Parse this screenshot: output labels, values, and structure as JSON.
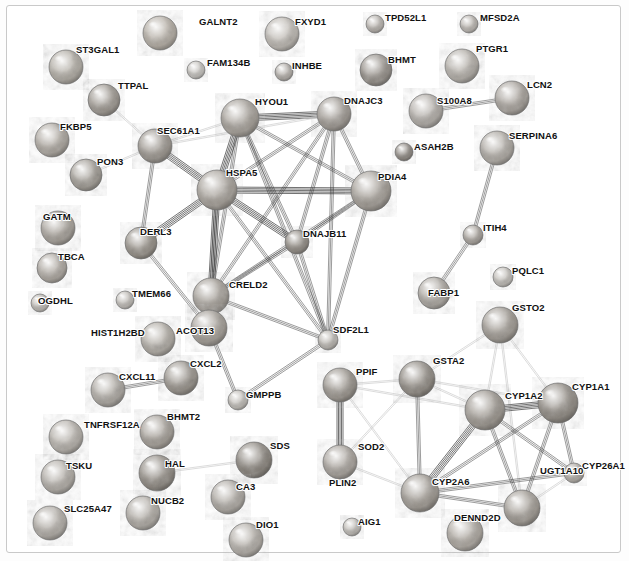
{
  "view": {
    "width": 629,
    "height": 561,
    "background": "#ffffff",
    "border_color": "#c9c9c9",
    "title": "Protein-protein interaction network"
  },
  "style": {
    "edge_color_dark": "#3a3a3a",
    "edge_color_mid": "#8a8a8a",
    "edge_color_light": "#c4c4c4",
    "label_color": "#111111",
    "node_outline": "#6e6e6e"
  },
  "nodes": [
    {
      "id": "GALNT2",
      "label": "GALNT2",
      "x": 160,
      "y": 33,
      "r": 17,
      "fill": "#b9b2a8",
      "lx": 199,
      "ly": 16
    },
    {
      "id": "FXYD1",
      "label": "FXYD1",
      "x": 282,
      "y": 34,
      "r": 17,
      "fill": "#c2bdb6",
      "lx": 295,
      "ly": 16
    },
    {
      "id": "TPD52L1",
      "label": "TPD52L1",
      "x": 375,
      "y": 24,
      "r": 9,
      "fill": "#b8b3ad",
      "lx": 385,
      "ly": 12
    },
    {
      "id": "MFSD2A",
      "label": "MFSD2A",
      "x": 469,
      "y": 24,
      "r": 9,
      "fill": "#bab5af",
      "lx": 480,
      "ly": 12
    },
    {
      "id": "ST3GAL1",
      "label": "ST3GAL1",
      "x": 66,
      "y": 67,
      "r": 17,
      "fill": "#b5b0a7",
      "lx": 76,
      "ly": 44
    },
    {
      "id": "FAM134B",
      "label": "FAM134B",
      "x": 196,
      "y": 70,
      "r": 9,
      "fill": "#c8c5c0",
      "lx": 207,
      "ly": 57
    },
    {
      "id": "INHBE",
      "label": "INHBE",
      "x": 284,
      "y": 72,
      "r": 9,
      "fill": "#b4afa9",
      "lx": 292,
      "ly": 60
    },
    {
      "id": "BHMT",
      "label": "BHMT",
      "x": 376,
      "y": 70,
      "r": 16,
      "fill": "#97918a",
      "lx": 388,
      "ly": 54
    },
    {
      "id": "PTGR1",
      "label": "PTGR1",
      "x": 462,
      "y": 66,
      "r": 17,
      "fill": "#b7b2ab",
      "lx": 476,
      "ly": 43
    },
    {
      "id": "TTPAL",
      "label": "TTPAL",
      "x": 104,
      "y": 100,
      "r": 16,
      "fill": "#a09a92",
      "lx": 118,
      "ly": 80
    },
    {
      "id": "HYOU1",
      "label": "HYOU1",
      "x": 240,
      "y": 118,
      "r": 19,
      "fill": "#a8a29a",
      "lx": 255,
      "ly": 96
    },
    {
      "id": "DNAJC3",
      "label": "DNAJC3",
      "x": 334,
      "y": 114,
      "r": 17,
      "fill": "#a39d96",
      "lx": 344,
      "ly": 95
    },
    {
      "id": "S100A8",
      "label": "S100A8",
      "x": 426,
      "y": 111,
      "r": 17,
      "fill": "#b6b1ab",
      "lx": 437,
      "ly": 95
    },
    {
      "id": "LCN2",
      "label": "LCN2",
      "x": 512,
      "y": 98,
      "r": 17,
      "fill": "#aaa49d",
      "lx": 527,
      "ly": 79
    },
    {
      "id": "FKBP5",
      "label": "FKBP5",
      "x": 52,
      "y": 140,
      "r": 17,
      "fill": "#b1aba3",
      "lx": 60,
      "ly": 121
    },
    {
      "id": "SEC61A1",
      "label": "SEC61A1",
      "x": 155,
      "y": 146,
      "r": 17,
      "fill": "#9f9991",
      "lx": 157,
      "ly": 125
    },
    {
      "id": "SERPINA6",
      "label": "SERPINA6",
      "x": 497,
      "y": 148,
      "r": 17,
      "fill": "#b2ada6",
      "lx": 509,
      "ly": 130
    },
    {
      "id": "ASAH2B",
      "label": "ASAH2B",
      "x": 404,
      "y": 152,
      "r": 9,
      "fill": "#8e8881",
      "lx": 414,
      "ly": 141
    },
    {
      "id": "PON3",
      "label": "PON3",
      "x": 86,
      "y": 175,
      "r": 16,
      "fill": "#a5a098",
      "lx": 97,
      "ly": 156
    },
    {
      "id": "HSPA5",
      "label": "HSPA5",
      "x": 217,
      "y": 190,
      "r": 20,
      "fill": "#a9a39b",
      "lx": 226,
      "ly": 167
    },
    {
      "id": "PDIA4",
      "label": "PDIA4",
      "x": 371,
      "y": 191,
      "r": 20,
      "fill": "#a8a29a",
      "lx": 378,
      "ly": 171
    },
    {
      "id": "GATM",
      "label": "GATM",
      "x": 58,
      "y": 228,
      "r": 17,
      "fill": "#aaa49c",
      "lx": 43,
      "ly": 211
    },
    {
      "id": "DERL3",
      "label": "DERL3",
      "x": 141,
      "y": 243,
      "r": 16,
      "fill": "#989289",
      "lx": 140,
      "ly": 226
    },
    {
      "id": "DNAJB11",
      "label": "DNAJB11",
      "x": 297,
      "y": 242,
      "r": 12,
      "fill": "#918b83",
      "lx": 303,
      "ly": 228
    },
    {
      "id": "ITIH4",
      "label": "ITIH4",
      "x": 473,
      "y": 235,
      "r": 10,
      "fill": "#a9a39c",
      "lx": 483,
      "ly": 222
    },
    {
      "id": "TBCA",
      "label": "TBCA",
      "x": 52,
      "y": 268,
      "r": 15,
      "fill": "#b0aaa2",
      "lx": 58,
      "ly": 251
    },
    {
      "id": "PQLC1",
      "label": "PQLC1",
      "x": 503,
      "y": 277,
      "r": 10,
      "fill": "#c4c0ba",
      "lx": 512,
      "ly": 265
    },
    {
      "id": "CRELD2",
      "label": "CRELD2",
      "x": 211,
      "y": 296,
      "r": 18,
      "fill": "#a6a098",
      "lx": 229,
      "ly": 279
    },
    {
      "id": "TMEM66",
      "label": "TMEM66",
      "x": 125,
      "y": 300,
      "r": 9,
      "fill": "#c1bdb7",
      "lx": 132,
      "ly": 288
    },
    {
      "id": "OGDHL",
      "label": "OGDHL",
      "x": 40,
      "y": 303,
      "r": 9,
      "fill": "#c0bcb6",
      "lx": 38,
      "ly": 295
    },
    {
      "id": "FABP1",
      "label": "FABP1",
      "x": 434,
      "y": 293,
      "r": 16,
      "fill": "#b0aba4",
      "lx": 428,
      "ly": 287
    },
    {
      "id": "GSTO2",
      "label": "GSTO2",
      "x": 500,
      "y": 325,
      "r": 18,
      "fill": "#a39d95",
      "lx": 512,
      "ly": 302
    },
    {
      "id": "SDF2L1",
      "label": "SDF2L1",
      "x": 328,
      "y": 340,
      "r": 10,
      "fill": "#bcb8b2",
      "lx": 333,
      "ly": 324
    },
    {
      "id": "HIST1H2BD",
      "label": "HIST1H2BD",
      "x": 158,
      "y": 339,
      "r": 17,
      "fill": "#b4afa7",
      "lx": 91,
      "ly": 327
    },
    {
      "id": "ACOT13",
      "label": "ACOT13",
      "x": 209,
      "y": 328,
      "r": 18,
      "fill": "#a7a199",
      "lx": 176,
      "ly": 325
    },
    {
      "id": "CXCL2",
      "label": "CXCL2",
      "x": 181,
      "y": 378,
      "r": 17,
      "fill": "#9b958d",
      "lx": 190,
      "ly": 358
    },
    {
      "id": "PPIF",
      "label": "PPIF",
      "x": 340,
      "y": 385,
      "r": 17,
      "fill": "#9d978f",
      "lx": 356,
      "ly": 366
    },
    {
      "id": "GSTA2",
      "label": "GSTA2",
      "x": 417,
      "y": 379,
      "r": 18,
      "fill": "#938d85",
      "lx": 433,
      "ly": 355
    },
    {
      "id": "CYP1A2",
      "label": "CYP1A2",
      "x": 485,
      "y": 410,
      "r": 20,
      "fill": "#a09a92",
      "lx": 505,
      "ly": 390
    },
    {
      "id": "CYP1A1",
      "label": "CYP1A1",
      "x": 558,
      "y": 403,
      "r": 20,
      "fill": "#938d85",
      "lx": 572,
      "ly": 381
    },
    {
      "id": "CXCL11",
      "label": "CXCL11",
      "x": 108,
      "y": 390,
      "r": 17,
      "fill": "#b1aca5",
      "lx": 119,
      "ly": 371
    },
    {
      "id": "GMPPB",
      "label": "GMPPB",
      "x": 238,
      "y": 400,
      "r": 10,
      "fill": "#c3bfb9",
      "lx": 246,
      "ly": 389
    },
    {
      "id": "TNFRSF12A",
      "label": "TNFRSF12A",
      "x": 66,
      "y": 437,
      "r": 17,
      "fill": "#b9b4ad",
      "lx": 84,
      "ly": 419
    },
    {
      "id": "BHMT2",
      "label": "BHMT2",
      "x": 157,
      "y": 432,
      "r": 17,
      "fill": "#a8a29a",
      "lx": 167,
      "ly": 411
    },
    {
      "id": "SDS",
      "label": "SDS",
      "x": 254,
      "y": 460,
      "r": 18,
      "fill": "#8b857d",
      "lx": 270,
      "ly": 440
    },
    {
      "id": "PLIN2",
      "label": "PLIN2",
      "x": 340,
      "y": 462,
      "r": 17,
      "fill": "#aaa49d",
      "lx": 329,
      "ly": 477
    },
    {
      "id": "SOD2",
      "label": "SOD2",
      "x": 340,
      "y": 462,
      "r": 0,
      "fill": "none",
      "lx": 358,
      "ly": 441
    },
    {
      "id": "TSKU",
      "label": "TSKU",
      "x": 58,
      "y": 477,
      "r": 17,
      "fill": "#b6b1aa",
      "lx": 66,
      "ly": 460
    },
    {
      "id": "HAL",
      "label": "HAL",
      "x": 157,
      "y": 473,
      "r": 18,
      "fill": "#938d85",
      "lx": 165,
      "ly": 458
    },
    {
      "id": "CA3",
      "label": "CA3",
      "x": 228,
      "y": 497,
      "r": 17,
      "fill": "#b2ada6",
      "lx": 236,
      "ly": 481
    },
    {
      "id": "CYP2A6",
      "label": "CYP2A6",
      "x": 420,
      "y": 493,
      "r": 19,
      "fill": "#a39d95",
      "lx": 432,
      "ly": 476
    },
    {
      "id": "CYP26A1",
      "label": "CYP26A1",
      "x": 574,
      "y": 473,
      "r": 10,
      "fill": "#b3aea7",
      "lx": 582,
      "ly": 460
    },
    {
      "id": "UGT1A10",
      "label": "UGT1A10",
      "x": 522,
      "y": 508,
      "r": 18,
      "fill": "#a59f97",
      "lx": 540,
      "ly": 465
    },
    {
      "id": "SLC25A47",
      "label": "SLC25A47",
      "x": 50,
      "y": 523,
      "r": 17,
      "fill": "#b5b0a9",
      "lx": 64,
      "ly": 503
    },
    {
      "id": "NUCB2",
      "label": "NUCB2",
      "x": 143,
      "y": 513,
      "r": 17,
      "fill": "#b4afa8",
      "lx": 151,
      "ly": 495
    },
    {
      "id": "DIO1",
      "label": "DIO1",
      "x": 246,
      "y": 540,
      "r": 17,
      "fill": "#b7b2ab",
      "lx": 256,
      "ly": 519
    },
    {
      "id": "AIG1",
      "label": "AIG1",
      "x": 352,
      "y": 527,
      "r": 9,
      "fill": "#c2beb8",
      "lx": 358,
      "ly": 516
    },
    {
      "id": "DENND2D",
      "label": "DENND2D",
      "x": 465,
      "y": 533,
      "r": 18,
      "fill": "#b1aba3",
      "lx": 454,
      "ly": 512
    }
  ],
  "edges": [
    {
      "source": "HYOU1",
      "target": "DNAJC3",
      "weight": "heavy"
    },
    {
      "source": "HYOU1",
      "target": "HSPA5",
      "weight": "heavy"
    },
    {
      "source": "HYOU1",
      "target": "SEC61A1",
      "weight": "light"
    },
    {
      "source": "HYOU1",
      "target": "PDIA4",
      "weight": "medium"
    },
    {
      "source": "HYOU1",
      "target": "DNAJB11",
      "weight": "medium"
    },
    {
      "source": "HYOU1",
      "target": "CRELD2",
      "weight": "medium"
    },
    {
      "source": "HYOU1",
      "target": "SDF2L1",
      "weight": "medium"
    },
    {
      "source": "DNAJC3",
      "target": "HSPA5",
      "weight": "medium"
    },
    {
      "source": "DNAJC3",
      "target": "PDIA4",
      "weight": "medium"
    },
    {
      "source": "DNAJC3",
      "target": "DNAJB11",
      "weight": "medium"
    },
    {
      "source": "DNAJC3",
      "target": "SDF2L1",
      "weight": "medium"
    },
    {
      "source": "DNAJC3",
      "target": "CRELD2",
      "weight": "medium"
    },
    {
      "source": "DNAJC3",
      "target": "SEC61A1",
      "weight": "light"
    },
    {
      "source": "HSPA5",
      "target": "SEC61A1",
      "weight": "heavy"
    },
    {
      "source": "HSPA5",
      "target": "DERL3",
      "weight": "heavy"
    },
    {
      "source": "HSPA5",
      "target": "PDIA4",
      "weight": "heavy"
    },
    {
      "source": "HSPA5",
      "target": "DNAJB11",
      "weight": "heavy"
    },
    {
      "source": "HSPA5",
      "target": "CRELD2",
      "weight": "heavy"
    },
    {
      "source": "HSPA5",
      "target": "SDF2L1",
      "weight": "medium"
    },
    {
      "source": "HSPA5",
      "target": "ACOT13",
      "weight": "medium"
    },
    {
      "source": "SEC61A1",
      "target": "DERL3",
      "weight": "medium"
    },
    {
      "source": "SEC61A1",
      "target": "TTPAL",
      "weight": "light"
    },
    {
      "source": "DERL3",
      "target": "ACOT13",
      "weight": "medium"
    },
    {
      "source": "PDIA4",
      "target": "DNAJB11",
      "weight": "medium"
    },
    {
      "source": "PDIA4",
      "target": "CRELD2",
      "weight": "medium"
    },
    {
      "source": "PDIA4",
      "target": "SDF2L1",
      "weight": "medium"
    },
    {
      "source": "DNAJB11",
      "target": "CRELD2",
      "weight": "medium"
    },
    {
      "source": "DNAJB11",
      "target": "SDF2L1",
      "weight": "medium"
    },
    {
      "source": "CRELD2",
      "target": "SDF2L1",
      "weight": "medium"
    },
    {
      "source": "CRELD2",
      "target": "ACOT13",
      "weight": "medium"
    },
    {
      "source": "ACOT13",
      "target": "GMPPB",
      "weight": "medium"
    },
    {
      "source": "SDF2L1",
      "target": "GMPPB",
      "weight": "medium"
    },
    {
      "source": "PON3",
      "target": "SEC61A1",
      "weight": "light"
    },
    {
      "source": "S100A8",
      "target": "LCN2",
      "weight": "medium"
    },
    {
      "source": "SERPINA6",
      "target": "ITIH4",
      "weight": "medium"
    },
    {
      "source": "ITIH4",
      "target": "FABP1",
      "weight": "medium"
    },
    {
      "source": "CXCL11",
      "target": "CXCL2",
      "weight": "medium"
    },
    {
      "source": "HAL",
      "target": "SDS",
      "weight": "light"
    },
    {
      "source": "PPIF",
      "target": "PLIN2",
      "weight": "heavy"
    },
    {
      "source": "PPIF",
      "target": "CYP1A2",
      "weight": "light"
    },
    {
      "source": "PPIF",
      "target": "GSTA2",
      "weight": "light"
    },
    {
      "source": "PPIF",
      "target": "CYP2A6",
      "weight": "light"
    },
    {
      "source": "PLIN2",
      "target": "CYP2A6",
      "weight": "light"
    },
    {
      "source": "PLIN2",
      "target": "GSTA2",
      "weight": "light"
    },
    {
      "source": "GSTA2",
      "target": "CYP1A2",
      "weight": "light"
    },
    {
      "source": "GSTA2",
      "target": "CYP2A6",
      "weight": "medium"
    },
    {
      "source": "GSTA2",
      "target": "GSTO2",
      "weight": "light"
    },
    {
      "source": "GSTA2",
      "target": "CYP1A1",
      "weight": "light"
    },
    {
      "source": "GSTO2",
      "target": "CYP1A2",
      "weight": "light"
    },
    {
      "source": "GSTO2",
      "target": "CYP1A1",
      "weight": "light"
    },
    {
      "source": "GSTO2",
      "target": "UGT1A10",
      "weight": "light"
    },
    {
      "source": "CYP1A2",
      "target": "CYP1A1",
      "weight": "heavy"
    },
    {
      "source": "CYP1A2",
      "target": "CYP2A6",
      "weight": "heavy"
    },
    {
      "source": "CYP1A2",
      "target": "CYP26A1",
      "weight": "medium"
    },
    {
      "source": "CYP1A2",
      "target": "UGT1A10",
      "weight": "medium"
    },
    {
      "source": "CYP1A1",
      "target": "CYP2A6",
      "weight": "medium"
    },
    {
      "source": "CYP1A1",
      "target": "CYP26A1",
      "weight": "medium"
    },
    {
      "source": "CYP1A1",
      "target": "UGT1A10",
      "weight": "medium"
    },
    {
      "source": "CYP2A6",
      "target": "CYP26A1",
      "weight": "medium"
    },
    {
      "source": "CYP2A6",
      "target": "UGT1A10",
      "weight": "medium"
    },
    {
      "source": "CYP26A1",
      "target": "UGT1A10",
      "weight": "light"
    }
  ]
}
